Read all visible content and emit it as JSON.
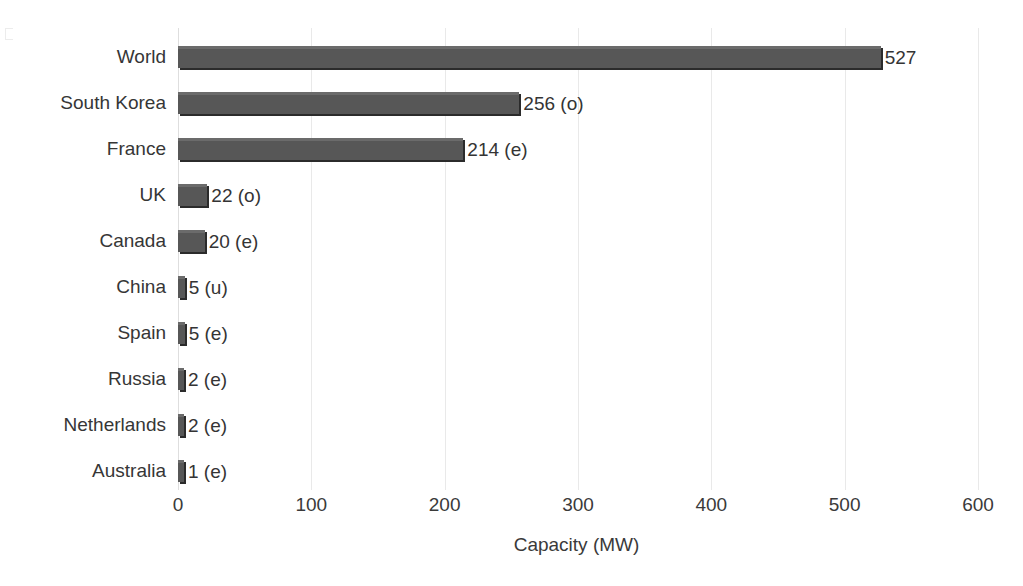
{
  "chart_data": {
    "type": "bar",
    "orientation": "horizontal",
    "title": "",
    "xlabel": "Capacity (MW)",
    "ylabel": "",
    "xlim": [
      0,
      600
    ],
    "xticks": [
      0,
      100,
      200,
      300,
      400,
      500,
      600
    ],
    "xtick_labels": [
      "0",
      "100",
      "200",
      "300",
      "400",
      "500",
      "600"
    ],
    "grid": true,
    "grid_axis": "x",
    "legend": false,
    "bar_color": "#575757",
    "bar_shadow_color": "#2b2b2b",
    "gridline_color": "#e9e9e9",
    "categories": [
      "World",
      "South Korea",
      "France",
      "UK",
      "Canada",
      "China",
      "Spain",
      "Russia",
      "Netherlands",
      "Australia"
    ],
    "values": [
      527,
      256,
      214,
      22,
      20,
      5,
      5,
      2,
      2,
      1
    ],
    "data_labels": [
      "527",
      "256 (o)",
      "214 (e)",
      "22 (o)",
      "20 (e)",
      "5 (u)",
      "5 (e)",
      "2 (e)",
      "2 (e)",
      "1 (e)"
    ],
    "status_codes": [
      "",
      "o",
      "e",
      "o",
      "e",
      "u",
      "e",
      "e",
      "e",
      "e"
    ],
    "bars": [
      {
        "category": "World",
        "value": 527,
        "label": "527"
      },
      {
        "category": "South Korea",
        "value": 256,
        "label": "256 (o)"
      },
      {
        "category": "France",
        "value": 214,
        "label": "214 (e)"
      },
      {
        "category": "UK",
        "value": 22,
        "label": "22 (o)"
      },
      {
        "category": "Canada",
        "value": 20,
        "label": "20 (e)"
      },
      {
        "category": "China",
        "value": 5,
        "label": "5 (u)"
      },
      {
        "category": "Spain",
        "value": 5,
        "label": "5 (e)"
      },
      {
        "category": "Russia",
        "value": 2,
        "label": "2 (e)"
      },
      {
        "category": "Netherlands",
        "value": 2,
        "label": "2 (e)"
      },
      {
        "category": "Australia",
        "value": 1,
        "label": "1 (e)"
      }
    ]
  }
}
